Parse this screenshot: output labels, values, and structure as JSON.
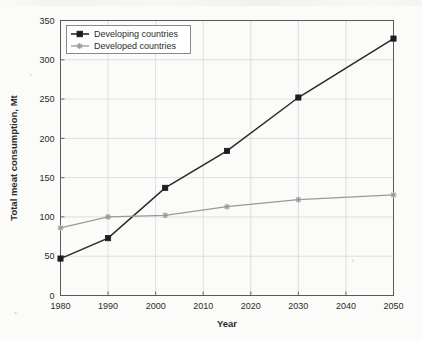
{
  "chart_data": {
    "type": "line",
    "title": "",
    "xlabel": "Year",
    "ylabel": "Total meat consumption, Mt",
    "xlim": [
      1980,
      2050
    ],
    "ylim": [
      0,
      350
    ],
    "xticks": [
      1980,
      1990,
      2000,
      2010,
      2020,
      2030,
      2040,
      2050
    ],
    "yticks": [
      0,
      50,
      100,
      150,
      200,
      250,
      300,
      350
    ],
    "grid": true,
    "legend_position": "top-left",
    "series": [
      {
        "name": "Developing countries",
        "color": "#1d1d1d",
        "marker": "square",
        "x": [
          1980,
          1990,
          2002,
          2015,
          2030,
          2050
        ],
        "values": [
          47,
          73,
          137,
          184,
          252,
          327
        ]
      },
      {
        "name": "Developed countries",
        "color": "#9a9a9a",
        "marker": "star",
        "x": [
          1980,
          1990,
          2002,
          2015,
          2030,
          2050
        ],
        "values": [
          86,
          100,
          102,
          113,
          122,
          128
        ]
      }
    ]
  },
  "legend": {
    "entries": [
      {
        "label": "Developing countries"
      },
      {
        "label": "Developed countries"
      }
    ]
  },
  "axes": {
    "x_title": "Year",
    "y_title": "Total meat consumption, Mt",
    "x_tick_labels": [
      "1980",
      "1990",
      "2000",
      "2010",
      "2020",
      "2030",
      "2040",
      "2050"
    ],
    "y_tick_labels": [
      "0",
      "50",
      "100",
      "150",
      "200",
      "250",
      "300",
      "350"
    ]
  }
}
